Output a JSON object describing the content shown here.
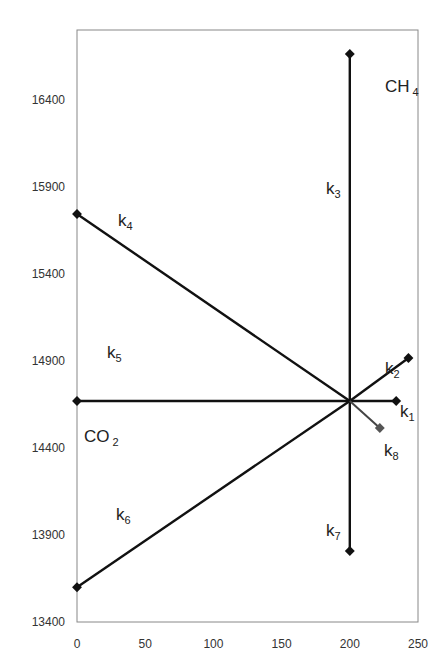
{
  "chart_data": {
    "type": "line",
    "title": "",
    "xlabel": "",
    "ylabel": "",
    "xlim": [
      0,
      250
    ],
    "ylim": [
      13400,
      16400
    ],
    "x_ticks": [
      "0",
      "50",
      "100",
      "150",
      "200",
      "250"
    ],
    "y_ticks": [
      "13400",
      "13900",
      "14400",
      "14900",
      "15400",
      "15900",
      "16400"
    ],
    "grid": false,
    "center": {
      "x": 200,
      "y": 14670
    },
    "series": [
      {
        "name": "k1",
        "from": [
          200,
          14670
        ],
        "to": [
          234,
          14670
        ]
      },
      {
        "name": "k2",
        "from": [
          200,
          14670
        ],
        "to": [
          243,
          14917
        ]
      },
      {
        "name": "k3",
        "from": [
          200,
          14670
        ],
        "to": [
          200,
          16664
        ]
      },
      {
        "name": "k4",
        "from": [
          200,
          14670
        ],
        "to": [
          0,
          15745
        ]
      },
      {
        "name": "k5",
        "from": [
          200,
          14670
        ],
        "to": [
          0,
          14670
        ]
      },
      {
        "name": "k6",
        "from": [
          200,
          14670
        ],
        "to": [
          0,
          13600
        ]
      },
      {
        "name": "k7",
        "from": [
          200,
          14670
        ],
        "to": [
          200,
          13808
        ]
      },
      {
        "name": "k8",
        "from": [
          200,
          14670
        ],
        "to": [
          222,
          14515
        ]
      }
    ],
    "annotations": [
      {
        "text": "CH",
        "sub": "4",
        "x": 385,
        "y": 92
      },
      {
        "text": "CO",
        "sub": "2",
        "x": 84,
        "y": 442
      },
      {
        "text": "k",
        "sub": "1",
        "x": 400,
        "y": 417
      },
      {
        "text": "k",
        "sub": "2",
        "x": 385,
        "y": 374
      },
      {
        "text": "k",
        "sub": "3",
        "x": 326,
        "y": 194
      },
      {
        "text": "k",
        "sub": "4",
        "x": 118,
        "y": 226
      },
      {
        "text": "k",
        "sub": "5",
        "x": 107,
        "y": 358
      },
      {
        "text": "k",
        "sub": "6",
        "x": 116,
        "y": 520
      },
      {
        "text": "k",
        "sub": "7",
        "x": 326,
        "y": 536
      },
      {
        "text": "k",
        "sub": "8",
        "x": 384,
        "y": 456
      }
    ]
  }
}
